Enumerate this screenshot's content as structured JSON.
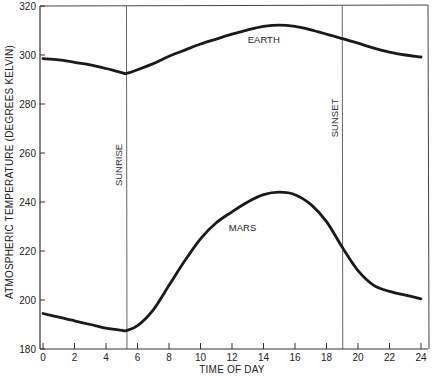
{
  "chart_data": {
    "type": "line",
    "title": "",
    "xlabel": "TIME OF DAY",
    "ylabel": "ATMOSPHERIC TEMPERATURE (DEGREES KELVIN)",
    "xlim": [
      0,
      24
    ],
    "ylim": [
      180,
      320
    ],
    "x_ticks": [
      0,
      2,
      4,
      6,
      8,
      10,
      12,
      14,
      16,
      18,
      20,
      22,
      24
    ],
    "y_ticks": [
      180,
      200,
      220,
      240,
      260,
      280,
      300,
      320
    ],
    "grid": false,
    "legend": "inline labels",
    "series": [
      {
        "name": "EARTH",
        "x": [
          0,
          1,
          2,
          3,
          4,
          5,
          5.3,
          6,
          7,
          8,
          9,
          10,
          11,
          12,
          13,
          14,
          15,
          16,
          17,
          18,
          19,
          20,
          21,
          22,
          23,
          24
        ],
        "values": [
          298.5,
          298,
          297,
          296,
          294.5,
          292.8,
          292.5,
          294,
          296.5,
          299.5,
          302,
          304.5,
          306.5,
          308.5,
          310.3,
          311.7,
          312.2,
          311.7,
          310.3,
          308.5,
          306.7,
          304.8,
          302.8,
          301.2,
          300,
          299.2
        ]
      },
      {
        "name": "MARS",
        "x": [
          0,
          1,
          2,
          3,
          4,
          5,
          5.3,
          6,
          7,
          8,
          9,
          10,
          11,
          12,
          13,
          14,
          15,
          16,
          17,
          18,
          19,
          20,
          21,
          22,
          23,
          24
        ],
        "values": [
          194.5,
          193,
          191.5,
          190,
          188.5,
          187.6,
          187.5,
          189.5,
          196,
          206,
          216,
          225,
          231.5,
          236,
          240,
          243,
          244,
          243,
          239,
          232,
          221.5,
          212,
          206,
          203.5,
          202,
          200.5
        ]
      }
    ],
    "annotations": [
      {
        "text": "SUNRISE",
        "x": 5.3,
        "type": "vertical-line"
      },
      {
        "text": "SUNSET",
        "x": 19.0,
        "type": "vertical-line"
      },
      {
        "text": "EARTH",
        "x": 13.0,
        "y": 305
      },
      {
        "text": "MARS",
        "x": 11.8,
        "y": 228
      }
    ]
  },
  "labels": {
    "caption_fragment": "... ATMOSPHERIC TEMPERATURE ... the ... with ... diurnal ..."
  }
}
